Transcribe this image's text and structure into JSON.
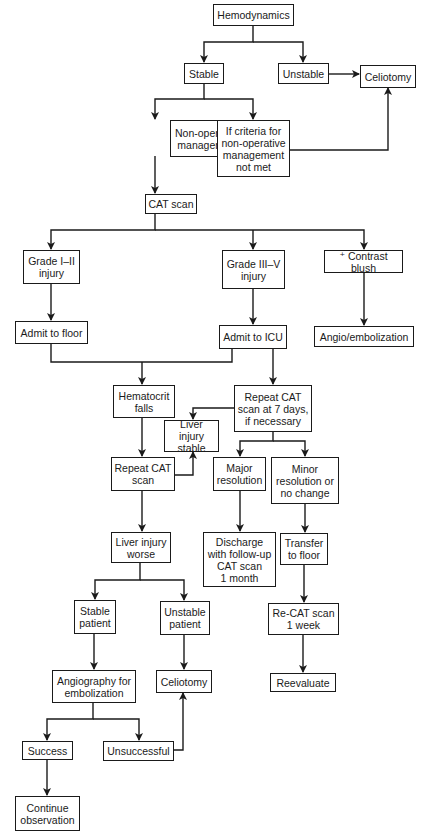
{
  "diagram": {
    "type": "flowchart",
    "colors": {
      "stroke": "#1a1a1a",
      "background": "#ffffff",
      "text": "#1a1a1a"
    },
    "nodes": {
      "hemodynamics": "Hemodynamics",
      "stable": "Stable",
      "unstable": "Unstable",
      "celiotomy_top": "Celiotomy",
      "nonop": "Non-operative\nmanagement",
      "criteria_not_met": "If criteria for\nnon-operative\nmanagement\nnot met",
      "cat_scan": "CAT scan",
      "grade_1_2": "Grade I–II\ninjury",
      "grade_3_5": "Grade III–V\ninjury",
      "contrast_blush": "⁺ Contrast blush",
      "admit_floor": "Admit to floor",
      "admit_icu": "Admit to ICU",
      "angio_embolization": "Angio/embolization",
      "hematocrit_falls": "Hematocrit\nfalls",
      "repeat_cat_7days": "Repeat CAT\nscan at 7 days,\nif necessary",
      "liver_stable": "Liver injury\nstable",
      "repeat_cat": "Repeat CAT\nscan",
      "major_resolution": "Major\nresolution",
      "minor_resolution": "Minor\nresolution or\nno change",
      "liver_worse": "Liver injury\nworse",
      "discharge": "Discharge\nwith follow-up\nCAT scan\n1 month",
      "transfer_floor": "Transfer\nto floor",
      "stable_patient": "Stable\npatient",
      "unstable_patient": "Unstable\npatient",
      "recat_week": "Re-CAT scan\n1 week",
      "angiography_embolization": "Angiography for\nembolization",
      "celiotomy_bottom": "Celiotomy",
      "reevaluate": "Reevaluate",
      "success": "Success",
      "unsuccessful": "Unsuccessful",
      "continue_observation": "Continue\nobservation"
    },
    "edges": [
      [
        "Hemodynamics",
        "Stable"
      ],
      [
        "Hemodynamics",
        "Unstable"
      ],
      [
        "Unstable",
        "Celiotomy"
      ],
      [
        "Stable",
        "Non-operative management"
      ],
      [
        "Stable",
        "If criteria for non-operative management not met"
      ],
      [
        "If criteria for non-operative management not met",
        "Celiotomy"
      ],
      [
        "Non-operative management",
        "CAT scan"
      ],
      [
        "CAT scan",
        "Grade I–II injury"
      ],
      [
        "CAT scan",
        "Grade III–V injury"
      ],
      [
        "CAT scan",
        "+ Contrast blush"
      ],
      [
        "Grade I–II injury",
        "Admit to floor"
      ],
      [
        "Grade III–V injury",
        "Admit to ICU"
      ],
      [
        "+ Contrast blush",
        "Angio/embolization"
      ],
      [
        "Admit to floor",
        "Hematocrit falls"
      ],
      [
        "Admit to ICU",
        "Hematocrit falls"
      ],
      [
        "Admit to ICU",
        "Repeat CAT scan at 7 days, if necessary"
      ],
      [
        "Repeat CAT scan at 7 days, if necessary",
        "Liver injury stable"
      ],
      [
        "Repeat CAT scan at 7 days, if necessary",
        "Major resolution"
      ],
      [
        "Repeat CAT scan at 7 days, if necessary",
        "Minor resolution or no change"
      ],
      [
        "Hematocrit falls",
        "Repeat CAT scan"
      ],
      [
        "Repeat CAT scan",
        "Liver injury stable"
      ],
      [
        "Repeat CAT scan",
        "Liver injury worse"
      ],
      [
        "Major resolution",
        "Discharge with follow-up CAT scan 1 month"
      ],
      [
        "Minor resolution or no change",
        "Transfer to floor"
      ],
      [
        "Transfer to floor",
        "Re-CAT scan 1 week"
      ],
      [
        "Re-CAT scan 1 week",
        "Reevaluate"
      ],
      [
        "Liver injury worse",
        "Stable patient"
      ],
      [
        "Liver injury worse",
        "Unstable patient"
      ],
      [
        "Stable patient",
        "Angiography for embolization"
      ],
      [
        "Unstable patient",
        "Celiotomy"
      ],
      [
        "Angiography for embolization",
        "Success"
      ],
      [
        "Angiography for embolization",
        "Unsuccessful"
      ],
      [
        "Unsuccessful",
        "Celiotomy"
      ],
      [
        "Success",
        "Continue observation"
      ]
    ]
  }
}
